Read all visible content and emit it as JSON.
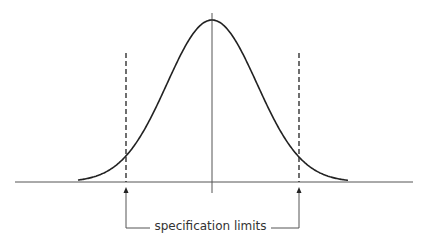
{
  "diagram": {
    "type": "normal-distribution-with-specification-limits",
    "annotation": "specification limits",
    "elements": {
      "curve": "bell curve (normal distribution)",
      "center_line": "mean",
      "left_limit": "lower specification limit (dashed)",
      "right_limit": "upper specification limit (dashed)"
    },
    "colors": {
      "line": "#222222",
      "axis": "#555555",
      "text": "#333333"
    }
  }
}
